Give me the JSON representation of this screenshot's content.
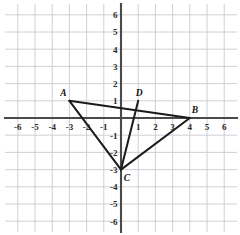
{
  "chart_data": {
    "type": "scatter",
    "title": "",
    "xlabel": "",
    "ylabel": "",
    "xlim": [
      -6.8,
      6.8
    ],
    "ylim": [
      -6.8,
      6.8
    ],
    "grid": true,
    "legend": null,
    "x_ticks": [
      -6,
      -5,
      -4,
      -3,
      -2,
      -1,
      1,
      2,
      3,
      4,
      5,
      6
    ],
    "y_ticks": [
      6,
      5,
      4,
      3,
      2,
      1,
      -1,
      -2,
      -3,
      -4,
      -5,
      -6
    ],
    "x_tick_labels": [
      "-6",
      "-5",
      "-4",
      "-3",
      "-2",
      "-1",
      "1",
      "2",
      "3",
      "4",
      "5",
      "6"
    ],
    "y_tick_labels": [
      "6",
      "5",
      "4",
      "3",
      "2",
      "1",
      "-1",
      "-2",
      "-3",
      "-4",
      "-5",
      "-6"
    ],
    "points": [
      {
        "name": "A",
        "x": -3,
        "y": 1,
        "label": "A",
        "label_dx": -6,
        "label_dy": -5
      },
      {
        "name": "B",
        "x": 4,
        "y": 0,
        "label": "B",
        "label_dx": 5,
        "label_dy": -5
      },
      {
        "name": "C",
        "x": 0,
        "y": -3,
        "label": "C",
        "label_dx": 6,
        "label_dy": 11
      },
      {
        "name": "D",
        "x": 1,
        "y": 1,
        "label": "D",
        "label_dx": 1,
        "label_dy": -5
      }
    ],
    "segments": [
      {
        "name": "segment-AB",
        "from": "A",
        "to": "B"
      },
      {
        "name": "segment-AC",
        "from": "A",
        "to": "C"
      },
      {
        "name": "segment-BC",
        "from": "B",
        "to": "C"
      },
      {
        "name": "segment-DC",
        "from": "D",
        "to": "C"
      }
    ],
    "annotations": [
      "Triangle ABC with vertices A(-3, 1), B(4, 0), C(0, -3)",
      "Cevian segment from D(1, 1) to C(0, -3)"
    ]
  },
  "colors": {
    "grid": "#c9c9d4",
    "axis": "#4a4a4a",
    "figure": "#1b1b1b",
    "label": "#111111",
    "background": "#ffffff"
  }
}
